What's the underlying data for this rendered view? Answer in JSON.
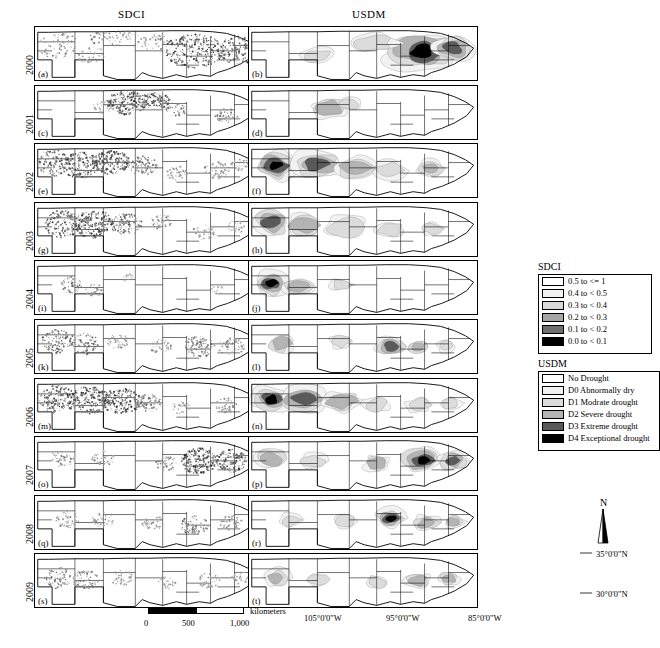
{
  "headers": {
    "sdci": "SDCI",
    "usdm": "USDM"
  },
  "years": [
    "2000",
    "2001",
    "2002",
    "2003",
    "2004",
    "2005",
    "2006",
    "2007",
    "2008",
    "2009"
  ],
  "panel_labels": {
    "sdci": [
      "(a)",
      "(c)",
      "(e)",
      "(g)",
      "(i)",
      "(k)",
      "(m)",
      "(o)",
      "(q)",
      "(s)"
    ],
    "usdm": [
      "(b)",
      "(d)",
      "(f)",
      "(h)",
      "(j)",
      "(l)",
      "(n)",
      "(p)",
      "(r)",
      "(t)"
    ]
  },
  "legends": {
    "sdci": {
      "title": "SDCI",
      "items": [
        {
          "label": "0.5 to <= 1",
          "color": "#ffffff"
        },
        {
          "label": "0.4 to < 0.5",
          "color": "#f2f2f2"
        },
        {
          "label": "0.3 to < 0.4",
          "color": "#d9d9d9"
        },
        {
          "label": "0.2 to < 0.3",
          "color": "#a6a6a6"
        },
        {
          "label": "0.1 to < 0.2",
          "color": "#6e6e6e"
        },
        {
          "label": "0.0 to < 0.1",
          "color": "#000000"
        }
      ]
    },
    "usdm": {
      "title": "USDM",
      "items": [
        {
          "label": "No Drought",
          "color": "#ffffff"
        },
        {
          "label": "D0 Abnormally dry",
          "color": "#f2f2f2"
        },
        {
          "label": "D1 Modrate drought",
          "color": "#dcdcdc"
        },
        {
          "label": "D2 Severe drought",
          "color": "#b4b4b4"
        },
        {
          "label": "D3 Extreme drought",
          "color": "#5a5a5a"
        },
        {
          "label": "D4 Exceptional drought",
          "color": "#000000"
        }
      ]
    }
  },
  "scalebar": {
    "unit": "kilometers",
    "ticks": [
      "0",
      "500",
      "1,000"
    ]
  },
  "north_arrow": {
    "label": "N"
  },
  "lat_labels": [
    "35°0'0\"N",
    "30°0'0\"N"
  ],
  "lon_labels": [
    "105°0'0\"W",
    "95°0'0\"W",
    "85°0'0\"W"
  ],
  "chart_data": {
    "type": "map-grid",
    "rows": 10,
    "cols": 2,
    "region": "Southern United States",
    "note": "Annual drought maps, SDCI (left column) and USDM (right column), 2000-2009"
  }
}
